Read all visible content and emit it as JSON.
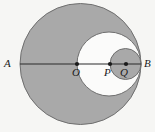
{
  "figure": {
    "background_color": "#f6f6f4",
    "shade_color": "#a9a9a9",
    "white_color": "#fbfbfa",
    "stroke_color": "#6f6f6f",
    "line_color": "#2b2b2b",
    "dot_color": "#1a1a1a"
  },
  "labels": {
    "a": "A",
    "b": "B",
    "o": "O",
    "p": "P",
    "q": "Q"
  },
  "chart_data": {
    "type": "scatter",
    "xlabel": "",
    "ylabel": "",
    "xlim": [
      0,
      155
    ],
    "ylim": [
      0,
      132
    ],
    "grid": false,
    "legend": "none",
    "baseline_y": 64,
    "circles": [
      {
        "name": "large-circle",
        "center_label": "O",
        "cx": 80.5,
        "cy": 64,
        "r": 60.5,
        "fill": "#a9a9a9",
        "stroke": "#6f6f6f"
      },
      {
        "name": "middle-circle",
        "center_label": "P",
        "cx": 109,
        "cy": 64,
        "r": 32,
        "fill": "#fbfbfa",
        "stroke": "#6f6f6f"
      },
      {
        "name": "small-circle",
        "center_label": "Q",
        "cx": 125.5,
        "cy": 64,
        "r": 15.5,
        "fill": "#a9a9a9",
        "stroke": "#6f6f6f"
      }
    ],
    "segment": {
      "name": "diameter-AB",
      "x1": 20,
      "y1": 64,
      "x2": 141,
      "y2": 64
    },
    "points": [
      {
        "label": "A",
        "x": 20,
        "y": 64,
        "marked": false,
        "label_x": 4,
        "label_y": 58
      },
      {
        "label": "O",
        "x": 77,
        "y": 64,
        "marked": true,
        "label_x": 72,
        "label_y": 67
      },
      {
        "label": "P",
        "x": 110,
        "y": 64,
        "marked": true,
        "label_x": 104,
        "label_y": 67
      },
      {
        "label": "Q",
        "x": 126,
        "y": 64,
        "marked": true,
        "label_x": 120,
        "label_y": 67
      },
      {
        "label": "B",
        "x": 141,
        "y": 64,
        "marked": false,
        "label_x": 144,
        "label_y": 58
      }
    ]
  }
}
